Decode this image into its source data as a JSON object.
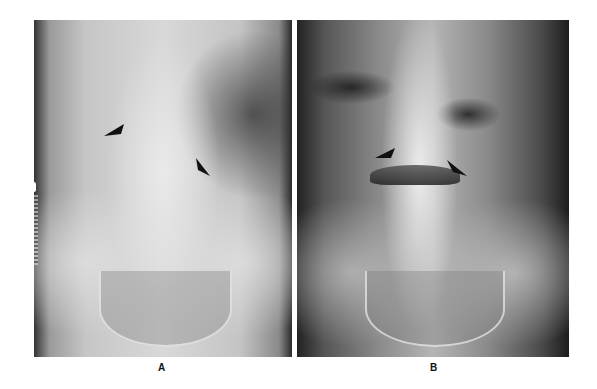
{
  "figure": {
    "panels": [
      {
        "id": "A",
        "label": "A",
        "description": "Supine abdominal radiograph with two black arrows pointing to soft-tissue density near lumbar spine"
      },
      {
        "id": "B",
        "label": "B",
        "description": "Upright abdominal radiograph with two black arrows indicating an air-fluid level across the midline"
      }
    ],
    "side_marking": "H C"
  }
}
